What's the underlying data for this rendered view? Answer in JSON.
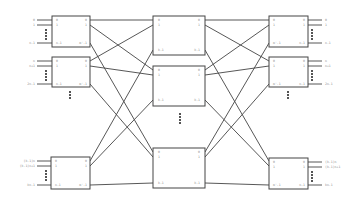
{
  "diagram": {
    "type": "clos-network",
    "colors": {
      "line": "#444444",
      "text": "#8a8a8a",
      "background": "#ffffff"
    },
    "input_stage": {
      "switches": [
        {
          "inputs": [
            "0",
            "1",
            "n-1"
          ],
          "in_ports": [
            "0",
            "1",
            "n-1"
          ],
          "out_ports": [
            "0",
            "1",
            "m'-1"
          ]
        },
        {
          "inputs": [
            "n",
            "n+1",
            "2n-1"
          ],
          "in_ports": [
            "0",
            "1",
            "n-1"
          ],
          "out_ports": [
            "0",
            "1",
            "m'-1"
          ]
        },
        {
          "inputs": [
            "(k-1)n",
            "(k-1)n+1",
            "kn-1"
          ],
          "in_ports": [
            "0",
            "1",
            "n-1"
          ],
          "out_ports": [
            "0",
            "1",
            "m'-1"
          ]
        }
      ]
    },
    "middle_stage": {
      "switches": [
        {
          "in_ports": [
            "0",
            "1",
            "k-1"
          ],
          "out_ports": [
            "0",
            "1",
            "k-1"
          ]
        },
        {
          "in_ports": [
            "0",
            "1",
            "k-1"
          ],
          "out_ports": [
            "0",
            "1",
            "k-1"
          ]
        },
        {
          "in_ports": [
            "0",
            "1",
            "k-1"
          ],
          "out_ports": [
            "0",
            "1",
            "k-1"
          ]
        }
      ]
    },
    "output_stage": {
      "switches": [
        {
          "in_ports": [
            "0",
            "1",
            "m'-1"
          ],
          "out_ports": [
            "0",
            "1",
            "n-1"
          ],
          "outputs": [
            "0",
            "1",
            "n-1"
          ]
        },
        {
          "in_ports": [
            "0",
            "1",
            "m'-1"
          ],
          "out_ports": [
            "0",
            "1",
            "n-1"
          ],
          "outputs": [
            "n",
            "n+1",
            "2n-1"
          ]
        },
        {
          "in_ports": [
            "0",
            "1",
            "m'-1"
          ],
          "out_ports": [
            "0",
            "1",
            "n-1"
          ],
          "outputs": [
            "(k-1)n",
            "(k-1)n+1",
            "kn-1"
          ]
        }
      ]
    }
  }
}
